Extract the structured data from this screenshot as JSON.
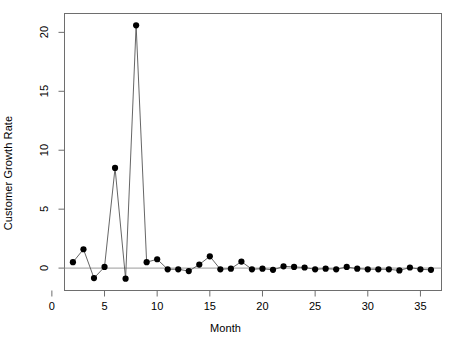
{
  "chart_data": {
    "type": "line",
    "title": "",
    "xlabel": "Month",
    "ylabel": "Customer Growth Rate",
    "xlim": [
      1.2,
      37.0
    ],
    "ylim": [
      -1.9,
      21.6
    ],
    "xticks": [
      0,
      5,
      10,
      15,
      20,
      25,
      30,
      35
    ],
    "xtick_labels": [
      "0",
      "5",
      "10",
      "15",
      "20",
      "25",
      "30",
      "35"
    ],
    "yticks": [
      0,
      5,
      10,
      15,
      20
    ],
    "ytick_labels": [
      "0",
      "5",
      "10",
      "15",
      "20"
    ],
    "grid": false,
    "zero_line": true,
    "legend": null,
    "marker": "filled-circle",
    "marker_color": "#000000",
    "line_color": "#555555",
    "x": [
      2,
      3,
      4,
      5,
      6,
      7,
      8,
      9,
      10,
      11,
      12,
      13,
      14,
      15,
      16,
      17,
      18,
      19,
      20,
      21,
      22,
      23,
      24,
      25,
      26,
      27,
      28,
      29,
      30,
      31,
      32,
      33,
      34,
      35,
      36
    ],
    "values": [
      0.5,
      1.6,
      -0.85,
      0.1,
      8.5,
      -0.9,
      20.6,
      0.5,
      0.75,
      -0.1,
      -0.1,
      -0.25,
      0.3,
      1.0,
      -0.1,
      -0.05,
      0.55,
      -0.1,
      -0.05,
      -0.15,
      0.15,
      0.1,
      0.05,
      -0.1,
      -0.05,
      -0.1,
      0.1,
      -0.05,
      -0.1,
      -0.1,
      -0.1,
      -0.2,
      0.05,
      -0.1,
      -0.15
    ]
  },
  "axes": {
    "x_title": "Month",
    "y_title": "Customer Growth Rate"
  }
}
